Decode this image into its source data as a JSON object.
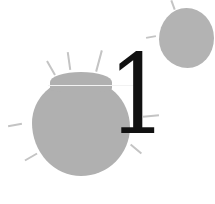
{
  "chapter": {
    "number": "1"
  },
  "colors": {
    "background": "#ffffff",
    "splat": "#b0b0b0",
    "numeral": "#111111"
  }
}
